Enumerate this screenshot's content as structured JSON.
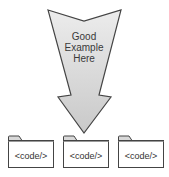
{
  "arrow": {
    "label_lines": [
      "Good",
      "Example",
      "Here"
    ],
    "fill_top": "#ececec",
    "fill_bottom": "#c9c9c9",
    "stroke": "#444444"
  },
  "folders": [
    {
      "label": "<code/>"
    },
    {
      "label": "<code/>"
    },
    {
      "label": "<code/>"
    }
  ],
  "colors": {
    "folder_stroke": "#444444",
    "folder_fill": "#ffffff",
    "folder_tab_fill": "#d8d8d8",
    "background": "#ffffff"
  }
}
